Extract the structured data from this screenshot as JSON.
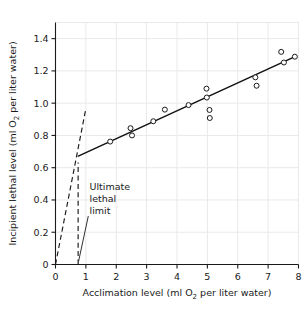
{
  "chart_data": {
    "type": "scatter",
    "title": "",
    "xlabel_parts": {
      "before": "Acclimation level (ml O",
      "sub": "2",
      "after": " per liter water)"
    },
    "ylabel_parts": {
      "before": "Incipient lethal level (ml O",
      "sub": "2",
      "after": " per liter water)"
    },
    "xlabel": "Acclimation level (ml O2 per liter water)",
    "ylabel": "Incipient lethal level (ml O2 per liter water)",
    "xlim": [
      0,
      8
    ],
    "ylim": [
      0,
      1.5
    ],
    "grid": true,
    "legend": "none",
    "xticks": [
      0,
      1,
      2,
      3,
      4,
      5,
      6,
      7,
      8
    ],
    "xtick_labels": [
      "0",
      "1",
      "2",
      "3",
      "4",
      "5",
      "6",
      "7",
      "8"
    ],
    "yticks": [
      0,
      0.2,
      0.4,
      0.6,
      0.8,
      1.0,
      1.2,
      1.4
    ],
    "ytick_labels": [
      "0",
      "0.2",
      "0.4",
      "0.6",
      "0.8",
      "1.0",
      "1.2",
      "1.4"
    ],
    "points": [
      {
        "x": 1.8,
        "y": 0.762
      },
      {
        "x": 2.47,
        "y": 0.845
      },
      {
        "x": 2.52,
        "y": 0.8
      },
      {
        "x": 3.22,
        "y": 0.888
      },
      {
        "x": 3.6,
        "y": 0.96
      },
      {
        "x": 4.38,
        "y": 0.988
      },
      {
        "x": 4.97,
        "y": 1.09
      },
      {
        "x": 4.98,
        "y": 1.035
      },
      {
        "x": 5.07,
        "y": 0.958
      },
      {
        "x": 5.08,
        "y": 0.908
      },
      {
        "x": 6.58,
        "y": 1.16
      },
      {
        "x": 6.62,
        "y": 1.108
      },
      {
        "x": 7.43,
        "y": 1.318
      },
      {
        "x": 7.52,
        "y": 1.252
      },
      {
        "x": 7.88,
        "y": 1.288
      }
    ],
    "fit_line": {
      "name": "incipient lethal level regression",
      "x0": 0.75,
      "y0": 0.672,
      "x1": 7.92,
      "y1": 1.292
    },
    "dashed_lines": [
      {
        "name": "equality line from origin",
        "x0": 0.0,
        "y0": 0.0,
        "x1": 0.985,
        "y1": 0.952
      },
      {
        "name": "ultimate lethal limit vertical",
        "x0": 0.745,
        "y0": 0.0,
        "x1": 0.745,
        "y1": 0.632
      }
    ],
    "annotations": [
      {
        "name": "ultimate-lethal-limit",
        "lines": [
          "Ultimate",
          "lethal",
          "limit"
        ],
        "text_x": 1.12,
        "text_y": 0.46,
        "leader": {
          "x0": 1.08,
          "y0": 0.3,
          "x1": 0.76,
          "y1": 0.02
        }
      }
    ],
    "colors": {
      "axis": "#1a1a1a",
      "grid": "#e9e9e9",
      "line": "#111111",
      "marker_stroke": "#1a1a1a",
      "marker_fill": "#ffffff",
      "dashed": "#1a1a1a",
      "background": "#ffffff"
    }
  }
}
